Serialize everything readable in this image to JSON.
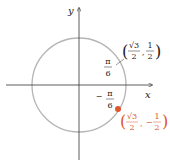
{
  "diagram": {
    "type": "unit-circle",
    "axes": {
      "x_label": "x",
      "y_label": "y"
    },
    "colors": {
      "circle": "#b5b5b5",
      "axis": "#333333",
      "point": "#e0542e",
      "text": "#222222",
      "highlight_text": "#e0542e"
    },
    "points": [
      {
        "angle_label": {
          "sign": "",
          "num": "π",
          "den": "6"
        },
        "coord_label": {
          "x_num": "√3",
          "x_den": "2",
          "sep": ",",
          "y_sign": "",
          "y_num": "1",
          "y_den": "2"
        },
        "highlighted": false
      },
      {
        "angle_label": {
          "sign": "−",
          "num": "π",
          "den": "6"
        },
        "coord_label": {
          "x_num": "√3",
          "x_den": "2",
          "sep": ",",
          "y_sign": "−",
          "y_num": "1",
          "y_den": "2"
        },
        "highlighted": true
      }
    ]
  }
}
